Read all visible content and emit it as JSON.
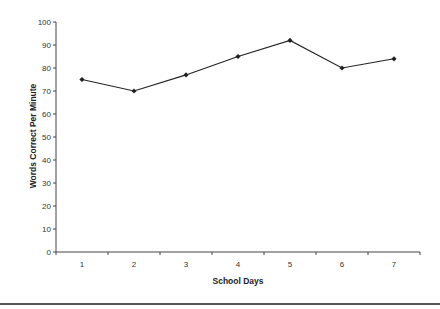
{
  "chart_data": {
    "type": "line",
    "title": "",
    "xlabel": "School Days",
    "ylabel": "Words Correct Per Minute",
    "categories": [
      "1",
      "2",
      "3",
      "4",
      "5",
      "6",
      "7"
    ],
    "series": [
      {
        "name": "Words Correct Per Minute",
        "values": [
          75,
          70,
          77,
          85,
          92,
          80,
          84
        ],
        "marker": "diamond",
        "color": "#222222"
      }
    ],
    "ylim": [
      0,
      100
    ],
    "yticks": [
      0,
      10,
      20,
      30,
      40,
      50,
      60,
      70,
      80,
      90,
      100
    ],
    "grid": false,
    "legend": "none"
  },
  "colors": {
    "line": "#222222",
    "axis": "#444444",
    "rule": "#555555"
  }
}
